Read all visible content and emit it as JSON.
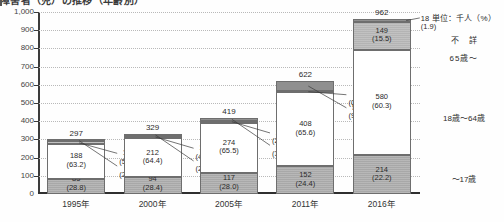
{
  "title": "障害者（児）の推移（年齢別）",
  "legend": {
    "unit": "単位：千人（%）",
    "items": [
      {
        "name": "unknown",
        "label": "不　詳"
      },
      {
        "name": "age-65-plus",
        "label": "65歳～"
      },
      {
        "name": "age-18-64",
        "label": "18歳～64歳"
      },
      {
        "name": "age-0-17",
        "label": "～17歳"
      }
    ]
  },
  "axis": {
    "y_ticks": [
      "1,000",
      "900",
      "800",
      "700",
      "600",
      "500",
      "400",
      "300",
      "200",
      "100",
      "0"
    ],
    "y_min": 0,
    "y_max": 1000,
    "y_step": 100,
    "x_ticks": [
      "1995年",
      "2000年",
      "2005年",
      "2011年",
      "2016年"
    ]
  },
  "chart_data": {
    "type": "bar",
    "subtype": "stacked",
    "title": "障害者（児）の推移（年齢別）",
    "xlabel": "",
    "ylabel": "",
    "unit": "単位：千人（%）",
    "ylim": [
      0,
      1000
    ],
    "y_step": 100,
    "grid": true,
    "legend_position": "right",
    "categories": [
      "1995年",
      "2000年",
      "2005年",
      "2011年",
      "2016年"
    ],
    "totals": [
      297,
      329,
      419,
      622,
      962
    ],
    "series": [
      {
        "name": "～17歳",
        "key": "age-0-17",
        "values": [
          85,
          94,
          117,
          152,
          214
        ],
        "percents": [
          28.8,
          28.4,
          28.0,
          24.4,
          22.2
        ]
      },
      {
        "name": "18歳～64歳",
        "key": "age-18-64",
        "values": [
          188,
          212,
          274,
          408,
          580
        ],
        "percents": [
          63.2,
          64.4,
          65.5,
          65.6,
          60.3
        ]
      },
      {
        "name": "65歳～",
        "key": "age-65-plus",
        "values": [
          16,
          14,
          12,
          4,
          149
        ],
        "percents": [
          5.4,
          4.4,
          2.9,
          0.6,
          15.5
        ]
      },
      {
        "name": "不詳",
        "key": "unknown",
        "values": [
          8,
          9,
          15,
          58,
          18
        ],
        "percents": [
          2.6,
          2.8,
          3.7,
          9.3,
          1.9
        ]
      }
    ]
  },
  "bars": [
    {
      "year": "1995年",
      "total": "297",
      "young_value": "85",
      "young_pct": "(28.8)",
      "mid_value": "188",
      "mid_pct": "(63.2)",
      "old_value": "16",
      "old_pct": "(5.4)",
      "unknown_value": "8",
      "unknown_pct": "(2.6)"
    },
    {
      "year": "2000年",
      "total": "329",
      "young_value": "94",
      "young_pct": "(28.4)",
      "mid_value": "212",
      "mid_pct": "(64.4)",
      "old_value": "14",
      "old_pct": "(4.4)",
      "unknown_value": "9",
      "unknown_pct": "(2.8)"
    },
    {
      "year": "2005年",
      "total": "419",
      "young_value": "117",
      "young_pct": "(28.0)",
      "mid_value": "274",
      "mid_pct": "(65.5)",
      "old_value": "12",
      "old_pct": "(2.9)",
      "unknown_value": "15",
      "unknown_pct": "(3.7)"
    },
    {
      "year": "2011年",
      "total": "622",
      "young_value": "152",
      "young_pct": "(24.4)",
      "mid_value": "408",
      "mid_pct": "(65.6)",
      "old_value": "4",
      "old_pct": "(0.6)",
      "unknown_value": "58",
      "unknown_pct": "(9.3)"
    },
    {
      "year": "2016年",
      "total": "962",
      "young_value": "214",
      "young_pct": "(22.2)",
      "mid_value": "580",
      "mid_pct": "(60.3)",
      "old_value": "149",
      "old_pct": "(15.5)",
      "unknown_value": "18",
      "unknown_pct": "(1.9)"
    }
  ],
  "colors": {
    "young": "#a8a8a8",
    "mid": "#ffffff",
    "old": "#b4b4b4",
    "unknown": "#8f8f8f",
    "axis": "#2f2f2f",
    "grid": "#b9b9b9",
    "text": "#2b2b2b"
  }
}
